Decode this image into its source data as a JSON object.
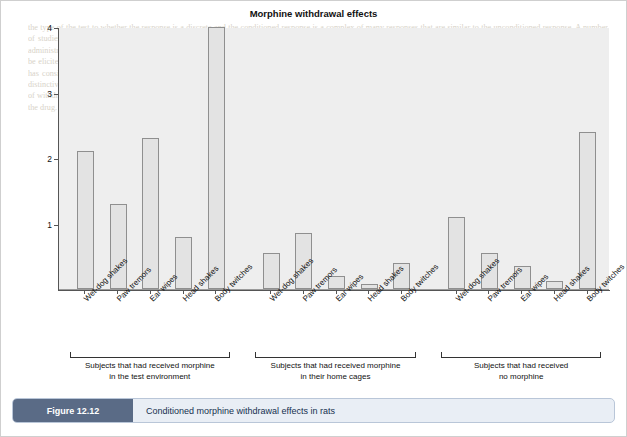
{
  "chart_data": {
    "type": "bar",
    "title": "Morphine withdrawal effects",
    "xlabel": "",
    "ylabel": "Mean number observed",
    "ylim": [
      0,
      4
    ],
    "yticks": [
      "1",
      "2",
      "3",
      "4"
    ],
    "ytick_values": [
      1,
      2,
      3,
      4
    ],
    "grid": false,
    "legend": "none",
    "categories": [
      "Wet-dog shakes",
      "Paw tremors",
      "Ear wipes",
      "Head shakes",
      "Body twitches",
      "Wet-dog shakes",
      "Paw tremors",
      "Ear wipes",
      "Head shakes",
      "Body twitches",
      "Wet-dog shakes",
      "Paw tremors",
      "Ear wipes",
      "Head shakes",
      "Body twitches"
    ],
    "values": [
      2.1,
      1.3,
      2.3,
      0.8,
      4.0,
      0.55,
      0.85,
      0.2,
      0.07,
      0.4,
      1.1,
      0.55,
      0.35,
      0.13,
      2.4
    ],
    "groups": [
      {
        "label": "Subjects that had received morphine\nin the test environment",
        "line1": "Subjects that had received morphine",
        "line2": "in the test environment",
        "start": 0,
        "end": 4
      },
      {
        "label": "Subjects that had received morphine\nin their home cages",
        "line1": "Subjects that had received morphine",
        "line2": "in their home cages",
        "start": 5,
        "end": 9
      },
      {
        "label": "Subjects that had received\nno morphine",
        "line1": "Subjects that had received",
        "line2": "no morphine",
        "start": 10,
        "end": 14
      }
    ],
    "colors": {
      "bar_fill": "#e3e3e3",
      "bar_stroke": "#8f8f8f",
      "plot_bg": "#eeeeee",
      "axis": "#555555"
    }
  },
  "caption": {
    "badge": "Figure 12.12",
    "text": "Conditioned morphine withdrawal effects in rats"
  },
  "bleed_text": "the type of the test to whether the response is a discrete and the conditioned response is a complex of many responses that are similar to the unconditioned response. A number of studies have examined the conditioning of withdrawal responses and the results show that such effects are reliably obtained in laboratory animals given repeated drug administration. The conditioned withdrawal responses observed in these studies are similar in form to those produced by the administration of an antagonist drug, and they can be elicited by environmental stimuli previously paired with the withdrawal state. The conditioned effects may persist long after the drug has been discontinued, a finding that has considerable relevance for the understanding of relapse in human addicts. In one demonstration of this phenomenon, rats received daily injections of morphine in one distinctive environment and placebo injections in another environment. After the drug treatment was discontinued, the animals were tested in each environment and the number of withdrawal signs was recorded. The results showed that the conditioned withdrawal effects were greatest in the environment previously associated with the administration of the drug."
}
